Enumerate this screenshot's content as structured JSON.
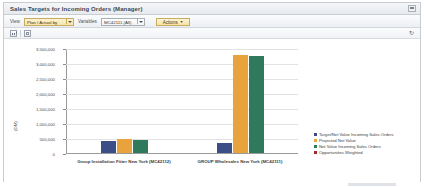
{
  "window": {
    "title": "Sales Targets for Incoming Orders (Manager)",
    "restore_button_name": "restore-window"
  },
  "toolbar": {
    "view_label": "View",
    "view_value": "Plan / Actual by",
    "variables_label": "Variables",
    "variables_value": "MC42111 (All)",
    "actions_label": "Actions",
    "actions_caret": "▼"
  },
  "iconbar": {
    "chart_view_icon": "bar-chart-icon",
    "table_view_icon": "table-grid-icon",
    "refresh_icon": "↻"
  },
  "chart_data": {
    "type": "bar",
    "title": "",
    "xlabel": "",
    "ylabel": "(DM)",
    "ylim": [
      0,
      3500000
    ],
    "grid": true,
    "legend_position": "right",
    "ytick_labels": [
      "3,500,000",
      "3,000,000",
      "2,500,000",
      "2,000,000",
      "1,500,000",
      "1,000,000",
      "500,000",
      "0"
    ],
    "ytick_values": [
      3500000,
      3000000,
      2500000,
      2000000,
      1500000,
      1000000,
      500000,
      0
    ],
    "categories": [
      "Group Installation Fitter New York (MC42112)",
      "GROUP Wholesales New York (MC42111)"
    ],
    "series": [
      {
        "name": "Target/Net Value Incoming Sales Orders",
        "color": "#3b4f86",
        "values": [
          400000,
          330000
        ]
      },
      {
        "name": "Projected Net Value",
        "color": "#e8a33d",
        "values": [
          480000,
          3280000
        ]
      },
      {
        "name": "Net Value Incoming Sales Orders",
        "color": "#2f7a5c",
        "values": [
          430000,
          3240000
        ]
      },
      {
        "name": "Opportunities Weighted",
        "color": "#9d2b2b",
        "values": [
          0,
          0
        ]
      }
    ]
  }
}
